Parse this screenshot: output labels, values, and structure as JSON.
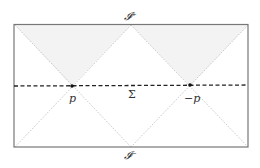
{
  "diagram": {
    "labels": {
      "scri_plus": "𝓘⁺",
      "scri_minus": "𝓘⁻",
      "sigma": "Σ",
      "point_p": "p",
      "point_minus_p": "−p"
    },
    "colors": {
      "frame": "#777777",
      "shade": "#f2f2f2",
      "slice": "#222222",
      "null_lines": "#aaaaaa"
    }
  }
}
